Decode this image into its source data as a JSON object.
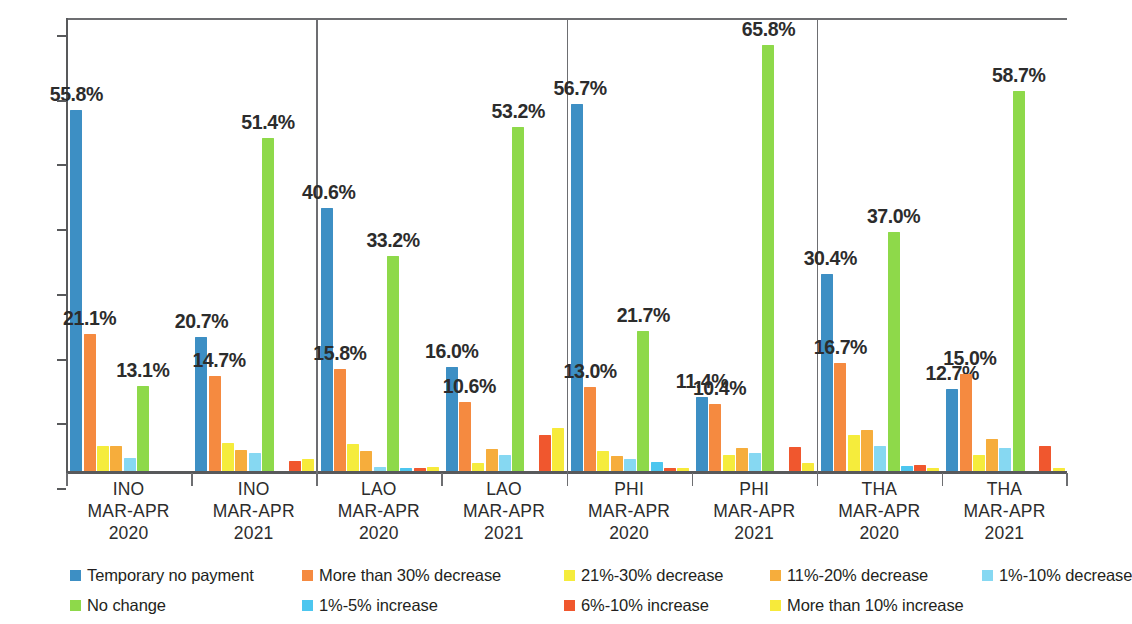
{
  "chart_data": {
    "type": "bar",
    "title": "",
    "subtitle": "",
    "xlabel": "",
    "ylabel": "",
    "ylim": [
      0,
      70
    ],
    "y_ticks": [
      "0%",
      "10%",
      "20%",
      "30%",
      "40%",
      "50%",
      "60%",
      "70%"
    ],
    "y_tick_values": [
      0,
      10,
      20,
      30,
      40,
      50,
      60,
      70
    ],
    "grid": false,
    "legend_position": "bottom",
    "value_suffix": "%",
    "categories": [
      "INO\nMAR-APR\n2020",
      "INO\nMAR-APR\n2021",
      "LAO\nMAR-APR\n2020",
      "LAO\nMAR-APR\n2021",
      "PHI\nMAR-APR\n2020",
      "PHI\nMAR-APR\n2021",
      "THA\nMAR-APR\n2020",
      "THA\nMAR-APR\n2021"
    ],
    "category_parts": [
      {
        "country": "INO",
        "period": "MAR-APR",
        "year": "2020"
      },
      {
        "country": "INO",
        "period": "MAR-APR",
        "year": "2021"
      },
      {
        "country": "LAO",
        "period": "MAR-APR",
        "year": "2020"
      },
      {
        "country": "LAO",
        "period": "MAR-APR",
        "year": "2021"
      },
      {
        "country": "PHI",
        "period": "MAR-APR",
        "year": "2020"
      },
      {
        "country": "PHI",
        "period": "MAR-APR",
        "year": "2021"
      },
      {
        "country": "THA",
        "period": "MAR-APR",
        "year": "2020"
      },
      {
        "country": "THA",
        "period": "MAR-APR",
        "year": "2021"
      }
    ],
    "series": [
      {
        "name": "Temporary no payment",
        "color": "#3d8fc4",
        "values": [
          55.8,
          20.7,
          40.6,
          16.0,
          56.7,
          11.4,
          30.4,
          12.7
        ],
        "labels": [
          "55.8%",
          "20.7%",
          "40.6%",
          "16.0%",
          "56.7%",
          "11.4%",
          "30.4%",
          "12.7%"
        ]
      },
      {
        "name": "More than 30% decrease",
        "color": "#f58a40",
        "values": [
          21.1,
          14.7,
          15.8,
          10.6,
          13.0,
          10.4,
          16.7,
          15.0
        ],
        "labels": [
          "21.1%",
          "14.7%",
          "15.8%",
          "10.6%",
          "13.0%",
          "10.4%",
          "16.7%",
          "15.0%"
        ]
      },
      {
        "name": "21%-30% decrease",
        "color": "#f5ec3c",
        "values": [
          3.9,
          4.3,
          4.1,
          1.3,
          3.1,
          2.5,
          5.5,
          2.5
        ],
        "labels": [
          "",
          "",
          "",
          "",
          "",
          "",
          "",
          ""
        ]
      },
      {
        "name": "11%-20% decrease",
        "color": "#f6ad3c",
        "values": [
          3.8,
          3.3,
          3.1,
          3.4,
          2.3,
          3.5,
          6.3,
          5.0
        ],
        "labels": [
          "",
          "",
          "",
          "",
          "",
          "",
          "",
          ""
        ]
      },
      {
        "name": "1%-10% decrease",
        "color": "#86d8f2",
        "values": [
          2.0,
          2.8,
          0.6,
          2.4,
          1.9,
          2.8,
          3.9,
          3.6
        ],
        "labels": [
          "",
          "",
          "",
          "",
          "",
          "",
          "",
          ""
        ]
      },
      {
        "name": "No change",
        "color": "#8ed94a",
        "values": [
          13.1,
          51.4,
          33.2,
          53.2,
          21.7,
          65.8,
          37.0,
          58.7
        ],
        "labels": [
          "13.1%",
          "51.4%",
          "33.2%",
          "53.2%",
          "21.7%",
          "65.8%",
          "37.0%",
          "58.7%"
        ]
      },
      {
        "name": "1%-5% increase",
        "color": "#4cc6ef",
        "values": [
          0.0,
          0.0,
          0.4,
          0.0,
          1.4,
          0.0,
          0.8,
          0.0
        ],
        "labels": [
          "",
          "",
          "",
          "",
          "",
          "",
          "",
          ""
        ]
      },
      {
        "name": "6%-10% increase",
        "color": "#f0572e",
        "values": [
          0.0,
          1.5,
          0.5,
          5.6,
          0.4,
          3.7,
          0.9,
          3.8
        ],
        "labels": [
          "",
          "",
          "",
          "",
          "",
          "",
          "",
          ""
        ]
      },
      {
        "name": "More than 10% increase",
        "color": "#f7ea3a",
        "values": [
          0.0,
          1.9,
          0.6,
          6.6,
          0.5,
          1.3,
          0.4,
          0.5
        ],
        "labels": [
          "",
          "",
          "",
          "",
          "",
          "",
          "",
          ""
        ]
      }
    ]
  },
  "legend": {
    "row1": [
      {
        "label": "Temporary no payment",
        "color": "#3d8fc4"
      },
      {
        "label": "More than 30% decrease",
        "color": "#f58a40"
      },
      {
        "label": "21%-30% decrease",
        "color": "#f5ec3c"
      },
      {
        "label": "11%-20% decrease",
        "color": "#f6ad3c"
      },
      {
        "label": "1%-10% decrease",
        "color": "#86d8f2"
      }
    ],
    "row2": [
      {
        "label": "No change",
        "color": "#8ed94a"
      },
      {
        "label": "1%-5% increase",
        "color": "#4cc6ef"
      },
      {
        "label": "6%-10% increase",
        "color": "#f0572e"
      },
      {
        "label": "More than 10% increase",
        "color": "#f7ea3a"
      }
    ]
  }
}
